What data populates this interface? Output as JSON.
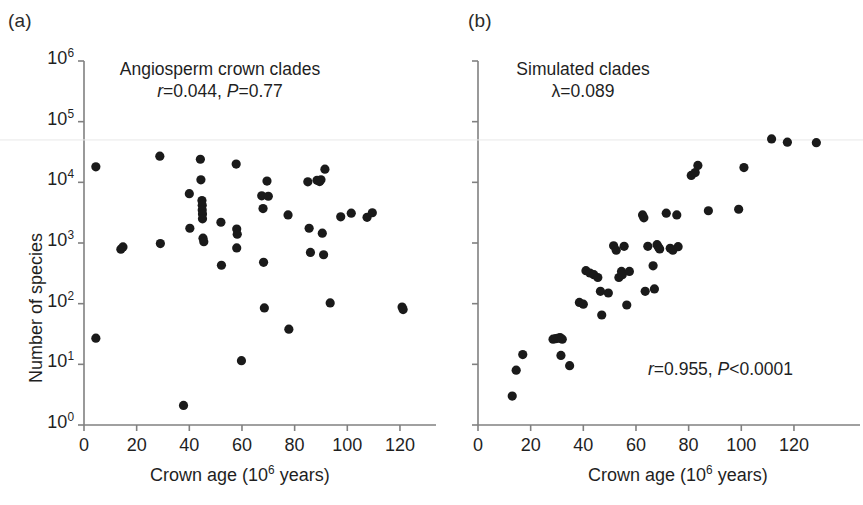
{
  "figure": {
    "background": "#ffffff",
    "point_color": "#1a1a1a",
    "axis_color": "#808080"
  },
  "panels": [
    {
      "id": "a",
      "label": "(a)",
      "annotation_title": "Angiosperm crown clades",
      "annotation_stat_r_symbol": "r",
      "annotation_stat_r_value": "=0.044,",
      "annotation_stat_p_symbol": "P",
      "annotation_stat_p_value": "=0.77",
      "xlabel_text": "Crown age (10",
      "xlabel_sup": "6",
      "xlabel_tail": " years)",
      "ylabel_text": "Number of species"
    },
    {
      "id": "b",
      "label": "(b)",
      "annotation_title": "Simulated clades",
      "annotation_lambda_symbol": "λ",
      "annotation_lambda_value": "=0.089",
      "annotation_stat_r_symbol": "r",
      "annotation_stat_r_value": "=0.955,",
      "annotation_stat_p_symbol": "P",
      "annotation_stat_p_value": "<0.0001",
      "xlabel_text": "Crown age (10",
      "xlabel_sup": "6",
      "xlabel_tail": " years)"
    }
  ],
  "chart_data": [
    {
      "type": "scatter",
      "panel": "a",
      "title": "Angiosperm crown clades",
      "xlabel": "Crown age (10^6 years)",
      "ylabel": "Number of species",
      "xlim": [
        0,
        133
      ],
      "ylim": [
        1,
        1000000
      ],
      "yscale": "log",
      "xticks": [
        0,
        20,
        40,
        60,
        80,
        100,
        120
      ],
      "xticklabels": [
        "0",
        "20",
        "40",
        "60",
        "80",
        "100",
        "120"
      ],
      "yticks": [
        1,
        10,
        100,
        1000,
        10000,
        100000,
        1000000
      ],
      "yticklabels": [
        "10^0",
        "10^1",
        "10^2",
        "10^3",
        "10^4",
        "10^5",
        "10^6"
      ],
      "grid": false,
      "legend": false,
      "annotations": [
        "r=0.044, P=0.77"
      ],
      "stats": {
        "r": 0.044,
        "P": 0.77
      },
      "points": [
        {
          "x": 4.5,
          "y": 18000
        },
        {
          "x": 4.5,
          "y": 27
        },
        {
          "x": 14.0,
          "y": 790
        },
        {
          "x": 14.8,
          "y": 860
        },
        {
          "x": 28.8,
          "y": 27000
        },
        {
          "x": 29.0,
          "y": 980
        },
        {
          "x": 37.8,
          "y": 2.1
        },
        {
          "x": 40.0,
          "y": 6500
        },
        {
          "x": 40.2,
          "y": 1750
        },
        {
          "x": 44.2,
          "y": 24000
        },
        {
          "x": 44.4,
          "y": 11000
        },
        {
          "x": 44.8,
          "y": 5000
        },
        {
          "x": 44.9,
          "y": 4200
        },
        {
          "x": 44.9,
          "y": 3500
        },
        {
          "x": 45.0,
          "y": 3000
        },
        {
          "x": 45.0,
          "y": 2500
        },
        {
          "x": 45.2,
          "y": 1200
        },
        {
          "x": 45.5,
          "y": 1050
        },
        {
          "x": 52.0,
          "y": 2200
        },
        {
          "x": 52.2,
          "y": 430
        },
        {
          "x": 57.8,
          "y": 20000
        },
        {
          "x": 58.0,
          "y": 1700
        },
        {
          "x": 58.2,
          "y": 1400
        },
        {
          "x": 58.0,
          "y": 830
        },
        {
          "x": 59.8,
          "y": 11.5
        },
        {
          "x": 67.5,
          "y": 6000
        },
        {
          "x": 68.0,
          "y": 3700
        },
        {
          "x": 68.2,
          "y": 480
        },
        {
          "x": 68.5,
          "y": 85
        },
        {
          "x": 69.5,
          "y": 10500
        },
        {
          "x": 70.0,
          "y": 5900
        },
        {
          "x": 77.5,
          "y": 2900
        },
        {
          "x": 77.8,
          "y": 38
        },
        {
          "x": 85.0,
          "y": 10200
        },
        {
          "x": 85.5,
          "y": 1750
        },
        {
          "x": 86.0,
          "y": 700
        },
        {
          "x": 88.5,
          "y": 10800
        },
        {
          "x": 89.5,
          "y": 10300
        },
        {
          "x": 90.0,
          "y": 11000
        },
        {
          "x": 90.5,
          "y": 1450
        },
        {
          "x": 91.0,
          "y": 640
        },
        {
          "x": 91.5,
          "y": 16500
        },
        {
          "x": 93.5,
          "y": 103
        },
        {
          "x": 97.5,
          "y": 2700
        },
        {
          "x": 101.5,
          "y": 3100
        },
        {
          "x": 107.5,
          "y": 2650
        },
        {
          "x": 109.5,
          "y": 3150
        },
        {
          "x": 120.8,
          "y": 88
        },
        {
          "x": 121.2,
          "y": 80
        }
      ]
    },
    {
      "type": "scatter",
      "panel": "b",
      "title": "Simulated clades",
      "xlabel": "Crown age (10^6 years)",
      "ylabel": "Number of species",
      "xlim": [
        0,
        133
      ],
      "ylim": [
        1,
        1000000
      ],
      "yscale": "log",
      "xticks": [
        0,
        20,
        40,
        60,
        80,
        100,
        120
      ],
      "xticklabels": [
        "0",
        "20",
        "40",
        "60",
        "80",
        "100",
        "120"
      ],
      "yticks": [
        1,
        10,
        100,
        1000,
        10000,
        100000,
        1000000
      ],
      "yticklabels": [
        "",
        "",
        "",
        "",
        "",
        "",
        ""
      ],
      "grid": false,
      "legend": false,
      "annotations": [
        "λ=0.089",
        "r=0.955, P<0.0001"
      ],
      "stats": {
        "lambda": 0.089,
        "r": 0.955,
        "P": 0.0001
      },
      "points": [
        {
          "x": 13.0,
          "y": 3.0
        },
        {
          "x": 14.5,
          "y": 8.0
        },
        {
          "x": 17.0,
          "y": 14.5
        },
        {
          "x": 28.5,
          "y": 26.0
        },
        {
          "x": 29.5,
          "y": 26.5
        },
        {
          "x": 30.5,
          "y": 27.0
        },
        {
          "x": 31.2,
          "y": 27.5
        },
        {
          "x": 32.0,
          "y": 26.0
        },
        {
          "x": 31.5,
          "y": 14.0
        },
        {
          "x": 34.8,
          "y": 9.5
        },
        {
          "x": 38.5,
          "y": 105
        },
        {
          "x": 40.0,
          "y": 98
        },
        {
          "x": 41.0,
          "y": 350
        },
        {
          "x": 42.5,
          "y": 320
        },
        {
          "x": 44.0,
          "y": 300
        },
        {
          "x": 45.5,
          "y": 270
        },
        {
          "x": 46.5,
          "y": 160
        },
        {
          "x": 47.0,
          "y": 65
        },
        {
          "x": 49.5,
          "y": 150
        },
        {
          "x": 51.5,
          "y": 900
        },
        {
          "x": 52.5,
          "y": 760
        },
        {
          "x": 53.5,
          "y": 270
        },
        {
          "x": 54.5,
          "y": 340
        },
        {
          "x": 54.8,
          "y": 300
        },
        {
          "x": 55.5,
          "y": 880
        },
        {
          "x": 56.5,
          "y": 95
        },
        {
          "x": 57.5,
          "y": 340
        },
        {
          "x": 62.5,
          "y": 2900
        },
        {
          "x": 63.0,
          "y": 2600
        },
        {
          "x": 63.5,
          "y": 160
        },
        {
          "x": 64.5,
          "y": 880
        },
        {
          "x": 66.5,
          "y": 420
        },
        {
          "x": 67.0,
          "y": 175
        },
        {
          "x": 68.0,
          "y": 940
        },
        {
          "x": 68.5,
          "y": 860
        },
        {
          "x": 69.0,
          "y": 800
        },
        {
          "x": 71.5,
          "y": 3100
        },
        {
          "x": 73.0,
          "y": 820
        },
        {
          "x": 74.0,
          "y": 760
        },
        {
          "x": 75.5,
          "y": 2900
        },
        {
          "x": 76.0,
          "y": 870
        },
        {
          "x": 81.0,
          "y": 13000
        },
        {
          "x": 82.5,
          "y": 14500
        },
        {
          "x": 83.5,
          "y": 19000
        },
        {
          "x": 87.5,
          "y": 3400
        },
        {
          "x": 99.0,
          "y": 3600
        },
        {
          "x": 101.0,
          "y": 17500
        },
        {
          "x": 111.5,
          "y": 52000
        },
        {
          "x": 117.5,
          "y": 46000
        },
        {
          "x": 128.5,
          "y": 45000
        }
      ]
    }
  ]
}
